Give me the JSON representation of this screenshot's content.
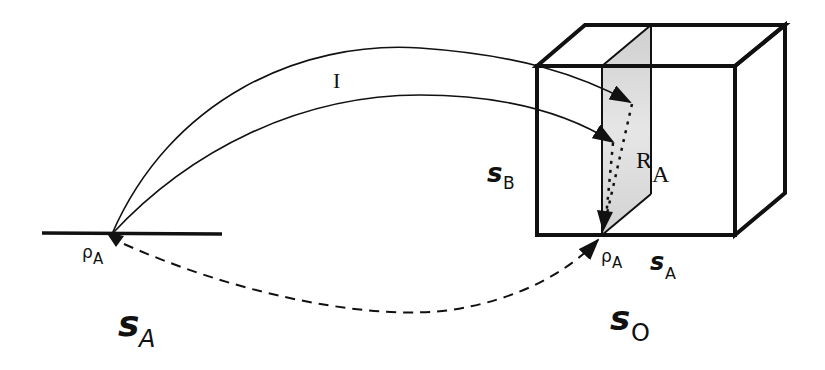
{
  "diagram": {
    "labels": {
      "intent": "I",
      "r_main": "R",
      "r_sub": "A",
      "s_b_main": "s",
      "s_b_sub": "B",
      "rho_left_main": "ρ",
      "rho_left_sub": "A",
      "rho_right_main": "ρ",
      "rho_right_sub": "A",
      "s_a_right_main": "s",
      "s_a_right_sub": "A",
      "s_a_left_main": "s",
      "s_a_left_sub": "A",
      "s_o_main": "s",
      "s_o_sub": "O"
    },
    "colors": {
      "stroke": "#111111",
      "plane_fill": "#d9d9d9",
      "background": "#ffffff"
    },
    "elements": [
      "left ground line (s_A space) with point ρA",
      "two solid curved arrows (I) from ρA into shaded plane R_A inside cube",
      "dotted arrows within plane converging down to ρA at cube base",
      "dashed curved arrow from left ρA to right ρA",
      "wireframe cube (s_O) with shaded vertical plane (R_A)"
    ]
  }
}
